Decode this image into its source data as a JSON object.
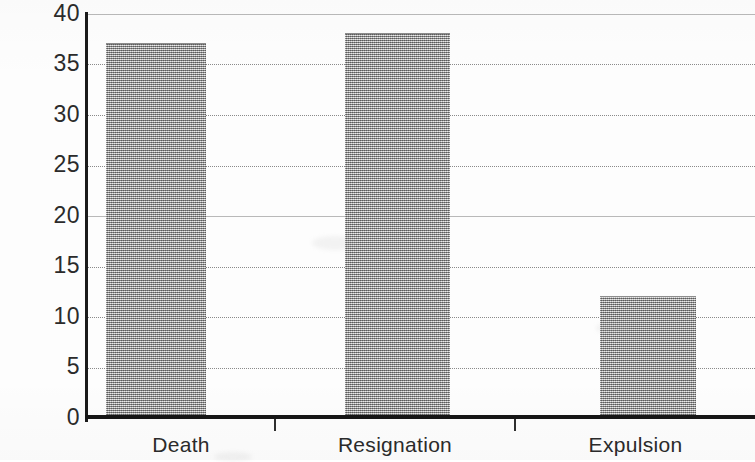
{
  "chart_data": {
    "type": "bar",
    "title": "",
    "subtitle": "",
    "xlabel": "",
    "ylabel": "",
    "categories": [
      "Death",
      "Resignation",
      "Expulsion"
    ],
    "values": [
      37,
      38,
      12
    ],
    "series": [
      {
        "name": "Count",
        "values": [
          37,
          38,
          12
        ]
      }
    ],
    "ylim": [
      0,
      40
    ],
    "y_ticks": [
      0,
      5,
      10,
      15,
      20,
      25,
      30,
      35,
      40
    ],
    "y_tick_labels": [
      "0",
      "5",
      "10",
      "15",
      "20",
      "25",
      "30",
      "35",
      "40"
    ],
    "grid": true,
    "grid_style": "dotted",
    "legend": false,
    "legend_position": "none",
    "bar_fill": "#a8a8a8",
    "bar_pattern": "checkerboard-dither",
    "axis_color": "#161616",
    "gridline_color": "#8a8a8a",
    "background": "#fdfdfd"
  },
  "axis": {
    "y_labels": [
      "40",
      "35",
      "30",
      "25",
      "20",
      "15",
      "10",
      "5",
      "0"
    ],
    "x_labels": [
      "Death",
      "Resignation",
      "Expulsion"
    ]
  },
  "bars": [
    {
      "label": "Death",
      "value": 37
    },
    {
      "label": "Resignation",
      "value": 38
    },
    {
      "label": "Expulsion",
      "value": 12
    }
  ]
}
